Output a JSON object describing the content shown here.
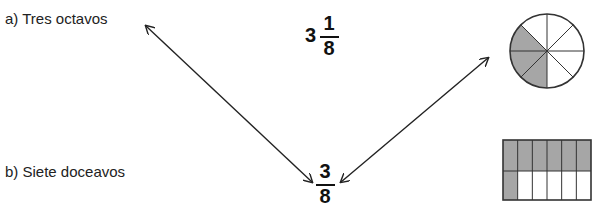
{
  "items": {
    "a": {
      "label": "a) Tres octavos"
    },
    "b": {
      "label": "b) Siete doceavos"
    }
  },
  "fractions": {
    "mixed": {
      "whole": "3",
      "numerator": "1",
      "denominator": "8"
    },
    "simple": {
      "numerator": "3",
      "denominator": "8"
    }
  },
  "figures": {
    "circle": {
      "parts": 8,
      "shaded": 3,
      "shade_color": "#a6a6a6"
    },
    "rectangle": {
      "parts": 12,
      "rows": 2,
      "cols": 6,
      "shaded": 7,
      "shade_color": "#a6a6a6"
    }
  },
  "arrows": [
    {
      "from": "fraction-3-8",
      "to": "label-a",
      "type": "double"
    },
    {
      "from": "fraction-3-8",
      "to": "circle-figure",
      "type": "double"
    }
  ]
}
